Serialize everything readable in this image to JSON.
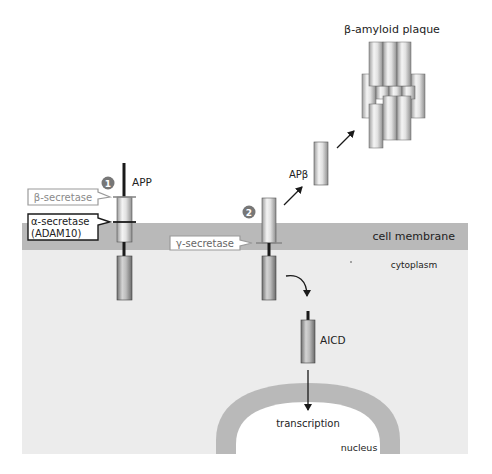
{
  "colors": {
    "background": "#ffffff",
    "membrane": "#b9b9b9",
    "cytoplasm": "#ececec",
    "nuclear_envelope": "#b9b9b9",
    "nucleus_interior": "#ffffff",
    "line": "#1a1a1a",
    "step_badge": "#777777",
    "callout_gray_border": "#9a9a9a",
    "callout_black_border": "#1a1a1a"
  },
  "regions": {
    "membrane": "cell membrane",
    "cytoplasm": "cytoplasm",
    "nucleus": "nucleus"
  },
  "steps": [
    {
      "number": "1",
      "protein": "APP"
    },
    {
      "number": "2"
    }
  ],
  "enzymes": {
    "beta": "β-secretase",
    "alpha_line1": "α-secretase",
    "alpha_line2": "(ADAM10)",
    "gamma": "γ-secretase"
  },
  "products": {
    "apb": "APβ",
    "plaque": "β-amyloid plaque",
    "aicd": "AICD",
    "transcription": "transcription"
  }
}
